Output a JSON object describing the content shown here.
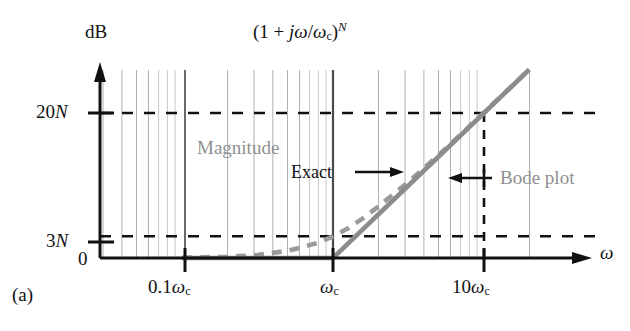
{
  "figure": {
    "panel_label": "(a)",
    "title": "(1 + jω/ωc)N",
    "title_parts": {
      "open": "(1 + ",
      "j": "j",
      "omega": "ω",
      "slash": "/",
      "omega_c": "ω",
      "sub_c": "c",
      "close": ")",
      "exp_N": "N"
    }
  },
  "chart_data": {
    "type": "line",
    "xlabel": "ω",
    "ylabel": "dB",
    "xscale": "log",
    "xlim_decades": [
      -2,
      1.35
    ],
    "ylim": [
      0,
      26
    ],
    "grid": "log-vertical-gray",
    "x_ticks": [
      {
        "label": "0.1ωc",
        "decade": -1
      },
      {
        "label": "ωc",
        "decade": 0
      },
      {
        "label": "10ωc",
        "decade": 1
      }
    ],
    "y_ticks": [
      {
        "label": "0",
        "value": 0
      },
      {
        "label": "3N",
        "value": 3
      },
      {
        "label": "20N",
        "value": 20
      }
    ],
    "reference_lines": [
      {
        "name": "20N-horizontal-dashed",
        "value": 20,
        "style": "dashed",
        "color": "#111111"
      },
      {
        "name": "3N-horizontal-dashed",
        "value": 3,
        "style": "dashed",
        "color": "#111111"
      },
      {
        "name": "10wc-vertical-dashed",
        "decade": 1,
        "style": "dashed",
        "color": "#111111"
      }
    ],
    "series": [
      {
        "name": "Bode plot",
        "style": "solid",
        "color": "#8c8c8c",
        "description": "Asymptotic straight-line approximation: 0 dB for ω<ωc, then +20N dB/decade",
        "points": [
          {
            "decade": -2,
            "db": 0
          },
          {
            "decade": -1,
            "db": 0
          },
          {
            "decade": 0,
            "db": 0
          },
          {
            "decade": 1,
            "db": 20
          },
          {
            "decade": 1.3,
            "db": 26
          }
        ]
      },
      {
        "name": "Exact",
        "style": "dashed",
        "color": "#9a9a9a",
        "description": "Exact magnitude 20N*log10(sqrt(1+(ω/ωc)^2)), equals 3N dB at ωc",
        "points": [
          {
            "decade": -2,
            "db": 0.0
          },
          {
            "decade": -1,
            "db": 0.04
          },
          {
            "decade": -0.7,
            "db": 0.17
          },
          {
            "decade": -0.5,
            "db": 0.41
          },
          {
            "decade": -0.3,
            "db": 1.0
          },
          {
            "decade": -0.2,
            "db": 1.5
          },
          {
            "decade": -0.1,
            "db": 2.1
          },
          {
            "decade": 0,
            "db": 3.0
          },
          {
            "decade": 0.1,
            "db": 4.1
          },
          {
            "decade": 0.2,
            "db": 5.5
          },
          {
            "decade": 0.3,
            "db": 7.1
          },
          {
            "decade": 0.5,
            "db": 10.5
          },
          {
            "decade": 0.7,
            "db": 14.2
          },
          {
            "decade": 1,
            "db": 20.04
          },
          {
            "decade": 1.3,
            "db": 26.02
          }
        ]
      }
    ],
    "annotations": [
      {
        "name": "magnitude-label",
        "text": "Magnitude",
        "color": "#8f8f8f"
      },
      {
        "name": "exact-label",
        "text": "Exact",
        "color": "#111111",
        "arrow": "right"
      },
      {
        "name": "bode-plot-label",
        "text": "Bode plot",
        "color": "#8f8f8f",
        "arrow": "left"
      }
    ]
  },
  "labels": {
    "y_axis_title": "dB",
    "x_axis_title": "ω",
    "y_20N_num": "20",
    "y_20N_var": "N",
    "y_3N_num": "3",
    "y_3N_var": "N",
    "y_zero": "0",
    "x_01wc_num": "0.1",
    "x_01wc_om": "ω",
    "x_01wc_sub": "c",
    "x_wc_om": "ω",
    "x_wc_sub": "c",
    "x_10wc_num": "10",
    "x_10wc_om": "ω",
    "x_10wc_sub": "c",
    "magnitude": "Magnitude",
    "exact": "Exact",
    "bode_plot": "Bode plot",
    "panel": "(a)"
  },
  "colors": {
    "axis": "#111111",
    "grid": "#b0b0b0",
    "bode_curve": "#8c8c8c",
    "exact_curve": "#9a9a9a",
    "dashed_ref": "#111111",
    "gray_text": "#8f8f8f",
    "background": "#ffffff"
  }
}
